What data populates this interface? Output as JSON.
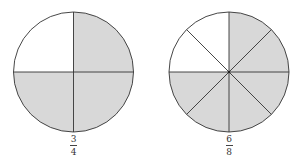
{
  "diagram": {
    "colors": {
      "shaded": "#d8d8d8",
      "unshaded": "#ffffff",
      "stroke": "#333333"
    },
    "circles": [
      {
        "id": "three-quarters",
        "cx": 73.5,
        "cy": 72,
        "r": 60,
        "parts": 4,
        "shaded_parts": 3,
        "shaded_segments": [
          "top-right",
          "bottom-right",
          "bottom-left"
        ],
        "label": {
          "numerator": "3",
          "denominator": "4"
        }
      },
      {
        "id": "six-eighths",
        "cx": 229,
        "cy": 72,
        "r": 60,
        "parts": 8,
        "shaded_parts": 6,
        "unshaded_segments": [
          "top-left upper",
          "top-left lower"
        ],
        "label": {
          "numerator": "6",
          "denominator": "8"
        }
      }
    ]
  }
}
